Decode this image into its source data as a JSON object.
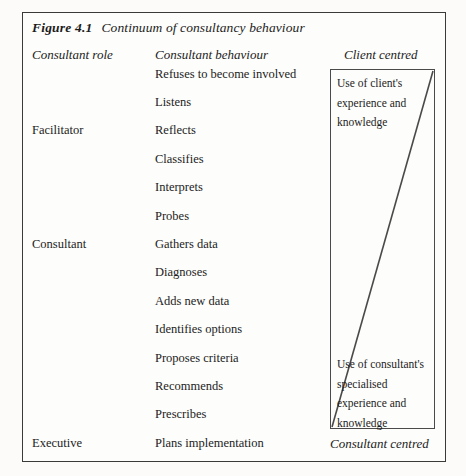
{
  "figure": {
    "number": "Figure 4.1",
    "caption": "Continuum of consultancy behaviour"
  },
  "headers": {
    "role": "Consultant role",
    "behaviour": "Consultant behaviour",
    "client_centred": "Client centred",
    "consultant_centred": "Consultant centred"
  },
  "rows": [
    {
      "role": "",
      "behaviour": "Refuses to become involved"
    },
    {
      "role": "",
      "behaviour": "Listens"
    },
    {
      "role": "Facilitator",
      "behaviour": "Reflects"
    },
    {
      "role": "",
      "behaviour": "Classifies"
    },
    {
      "role": "",
      "behaviour": "Interprets"
    },
    {
      "role": "",
      "behaviour": "Probes"
    },
    {
      "role": "Consultant",
      "behaviour": "Gathers data"
    },
    {
      "role": "",
      "behaviour": "Diagnoses"
    },
    {
      "role": "",
      "behaviour": "Adds new data"
    },
    {
      "role": "",
      "behaviour": "Identifies options"
    },
    {
      "role": "",
      "behaviour": "Proposes criteria"
    },
    {
      "role": "",
      "behaviour": "Recommends"
    },
    {
      "role": "",
      "behaviour": "Prescribes"
    },
    {
      "role": "Executive",
      "behaviour": "Plans implementation"
    }
  ],
  "continuum": {
    "top_block_lines": [
      "Use of client's",
      "experience and",
      "knowledge"
    ],
    "bottom_block_lines": [
      "Use of consultant's",
      "specialised",
      "experience and",
      "knowledge"
    ]
  },
  "colors": {
    "ink": "#1c1c1c",
    "frame": "#3a3a3a",
    "inner_frame": "#4a4a4a",
    "page": "#fcfbf9"
  }
}
